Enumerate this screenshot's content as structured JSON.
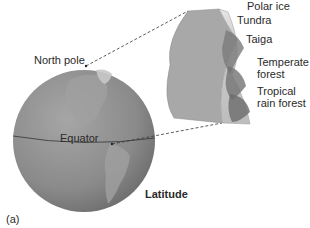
{
  "figure": {
    "panel_label": "(a)",
    "globe": {
      "north_pole_label": "North pole",
      "equator_label": "Equator"
    },
    "axis_label": "Latitude",
    "biome_labels": [
      "Polar ice",
      "Tundra",
      "Taiga",
      "Temperate forest",
      "Tropical rain forest"
    ],
    "colors": {
      "globe": "#8c8c8c",
      "land": "#a3a3a3",
      "wedge_face": "#a8a8a8",
      "wedge_side": "#d8d8d8",
      "vegetation": "#707070"
    }
  }
}
